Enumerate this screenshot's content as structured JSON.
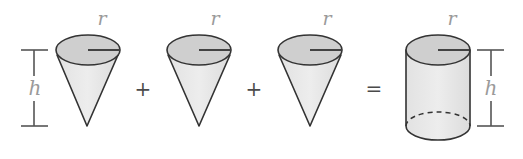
{
  "diagram": {
    "labels": {
      "radius": "r",
      "height": "h"
    },
    "operators": {
      "plus_1": "+",
      "plus_2": "+",
      "equals": "="
    },
    "shapes": [
      {
        "type": "cone",
        "label_radius": "r",
        "label_height": "h"
      },
      {
        "type": "cone",
        "label_radius": "r"
      },
      {
        "type": "cone",
        "label_radius": "r"
      },
      {
        "type": "cylinder",
        "label_radius": "r",
        "label_height": "h"
      }
    ],
    "colors": {
      "outline": "#333333",
      "top_fill": "#cfcfcf",
      "body_fill": "#e8e8e8",
      "label": "#9a9a9a",
      "dimension_line": "#555555"
    }
  }
}
